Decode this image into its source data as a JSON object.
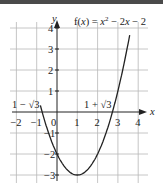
{
  "chart_data": {
    "type": "line",
    "function": "x^2 - 2x - 2",
    "xlabel": "x",
    "ylabel": "y",
    "xlim": [
      -2,
      4
    ],
    "ylim": [
      -3,
      4
    ],
    "x_ticks": [
      -2,
      -1,
      0,
      1,
      2,
      3,
      4
    ],
    "x_tick_labels": [
      "−2",
      "−1",
      "0",
      "1",
      "2",
      "3",
      "4"
    ],
    "y_ticks": [
      -3,
      -2,
      -1,
      1,
      2,
      3,
      4
    ],
    "y_tick_labels": [
      "−3",
      "−2",
      "−1",
      "1",
      "2",
      "3",
      "4"
    ],
    "grid": true,
    "vertex": {
      "x": 1,
      "y": -3
    },
    "roots": [
      {
        "label": "1 − √3",
        "x": -0.732
      },
      {
        "label": "1 + √3",
        "x": 2.732
      }
    ],
    "series": [
      {
        "name": "f(x)",
        "x": [
          -0.8,
          -0.5,
          0,
          0.5,
          1,
          1.5,
          2,
          2.5,
          3,
          3.6
        ],
        "y": [
          0.24,
          -0.75,
          -2,
          -2.75,
          -3,
          -2.75,
          -2,
          -0.75,
          1,
          3.76
        ]
      }
    ]
  },
  "labels": {
    "title_prefix": "f(",
    "title_var": "x",
    "title_mid": ") = ",
    "title_x2": "x",
    "title_sup": "2",
    "title_rest": " − 2",
    "title_x": "x",
    "title_end": " − 2",
    "root_left": "1 − √3",
    "root_right": "1 + √3",
    "x_axis": "x",
    "y_axis": "y",
    "origin": "0"
  }
}
